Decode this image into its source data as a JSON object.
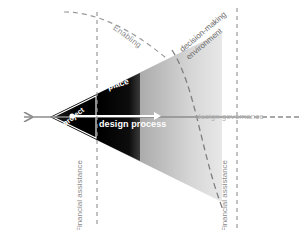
{
  "diagram": {
    "labels": {
      "enabling": "Enabling",
      "decision_making_line1": "decision-making",
      "decision_making_line2": "environment",
      "project": "project",
      "place": "place",
      "design_process": "design process",
      "design_governance": "design governance",
      "financial_assistance_left": "Financial assistance",
      "financial_assistance_right": "Financial assistance"
    },
    "colors": {
      "cone_fill_dark": "#000000",
      "cone_fill_mid": "#6e6e6e",
      "cone_fill_light": "#e2e2e2",
      "axis_arrow": "#8c8c8c",
      "dashed_line": "#9a9a9a",
      "label_gray": "#8a8a8a",
      "label_white": "#ffffff",
      "background": "#ffffff"
    },
    "elements": {
      "axis_arrow_name": "left-pointing-axis-arrow",
      "inner_arrow_name": "design-process-arrow",
      "vertical_dashed_left": "left-boundary-dashed-line",
      "vertical_dashed_right": "right-boundary-dashed-line",
      "enabling_arc": "enabling-dashed-arc",
      "dme_arc": "decision-making-environment-dashed-arc"
    }
  }
}
